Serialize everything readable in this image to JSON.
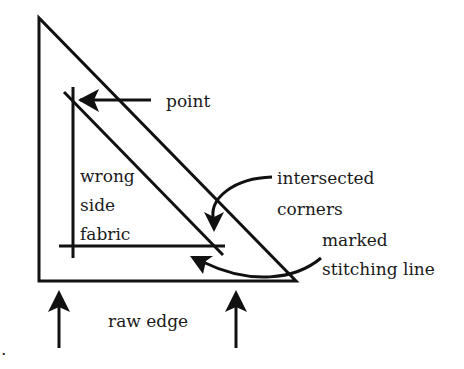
{
  "diagram": {
    "labels": {
      "point": "point",
      "wrong_side_1": "wrong",
      "wrong_side_2": "side",
      "wrong_side_3": "fabric",
      "intersected_1": "intersected",
      "intersected_2": "corners",
      "marked_1": "marked",
      "marked_2": "stitching line",
      "raw_edge": "raw edge",
      "stray_dot": "."
    },
    "colors": {
      "ink": "#111111",
      "background": "#ffffff"
    }
  }
}
